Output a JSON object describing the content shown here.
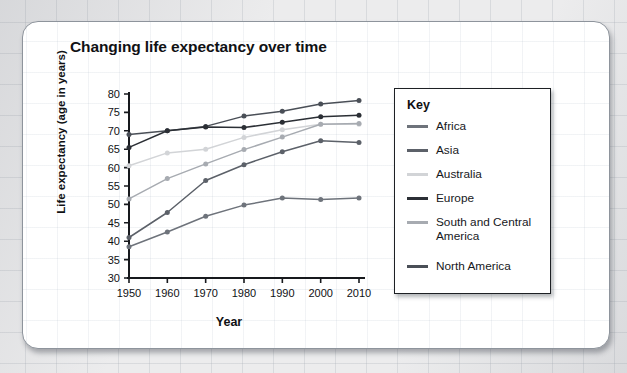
{
  "card": {
    "title": "Changing life expectancy over time"
  },
  "key": {
    "heading": "Key",
    "entries": [
      {
        "label": "Africa",
        "color": "#6e737b"
      },
      {
        "label": "Asia",
        "color": "#5c6169"
      },
      {
        "label": "Australia",
        "color": "#d2d4d7"
      },
      {
        "label": "Europe",
        "color": "#2b2f35"
      },
      {
        "label": "South and Central America",
        "color": "#a7abb1"
      },
      {
        "label": "North America",
        "color": "#4a4f57"
      }
    ]
  },
  "chart_data": {
    "type": "line",
    "title": "Changing life expectancy over time",
    "xlabel": "Year",
    "ylabel": "Life expectancy (age in years)",
    "x": [
      1950,
      1960,
      1970,
      1980,
      1990,
      2000,
      2010
    ],
    "xtick_labels": [
      "1950",
      "1960",
      "1970",
      "1980",
      "1990",
      "2000",
      "2010"
    ],
    "ytick_labels": [
      "30",
      "35",
      "40",
      "45",
      "50",
      "55",
      "60",
      "65",
      "70",
      "75",
      "80"
    ],
    "yticks": [
      30,
      35,
      40,
      45,
      50,
      55,
      60,
      65,
      70,
      75,
      80
    ],
    "xlim": [
      1950,
      2010
    ],
    "ylim": [
      30,
      80
    ],
    "grid": false,
    "markers": true,
    "legend_position": "right-outside",
    "series": [
      {
        "name": "Africa",
        "color": "#6e737b",
        "values": [
          38.5,
          42.5,
          46.8,
          49.8,
          51.7,
          51.3,
          51.7
        ]
      },
      {
        "name": "Asia",
        "color": "#5c6169",
        "values": [
          41.0,
          47.8,
          56.5,
          60.8,
          64.3,
          67.3,
          66.8
        ]
      },
      {
        "name": "Australia",
        "color": "#d2d4d7",
        "values": [
          60.5,
          64.0,
          65.0,
          68.2,
          70.3,
          71.8,
          71.8
        ]
      },
      {
        "name": "Europe",
        "color": "#2b2f35",
        "values": [
          65.5,
          70.0,
          71.0,
          70.9,
          72.3,
          73.8,
          74.2
        ]
      },
      {
        "name": "South and Central America",
        "color": "#a7abb1",
        "values": [
          51.5,
          57.0,
          61.0,
          64.9,
          68.3,
          71.8,
          72.0
        ]
      },
      {
        "name": "North America",
        "color": "#4a4f57",
        "values": [
          69.0,
          70.0,
          71.2,
          74.0,
          75.3,
          77.3,
          78.2
        ]
      }
    ]
  }
}
